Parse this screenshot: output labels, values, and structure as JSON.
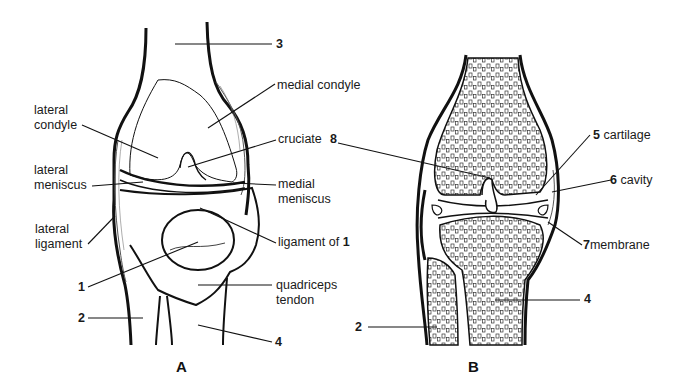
{
  "figures": [
    {
      "id": "A",
      "caption": "A"
    },
    {
      "id": "B",
      "caption": "B"
    }
  ],
  "figure_a": {
    "labels": {
      "n3": "3",
      "medial_condyle": "medial condyle",
      "lateral_condyle_1": "lateral",
      "lateral_condyle_2": "condyle",
      "cruciate": "cruciate",
      "n8": "8",
      "lateral_meniscus_1": "lateral",
      "lateral_meniscus_2": "meniscus",
      "medial_meniscus_1": "medial",
      "medial_meniscus_2": "meniscus",
      "lateral_ligament_1": "lateral",
      "lateral_ligament_2": "ligament",
      "ligament_of": "ligament of",
      "ligament_of_num": "1",
      "n1": "1",
      "quadriceps_1": "quadriceps",
      "quadriceps_2": "tendon",
      "n2": "2",
      "n4": "4"
    }
  },
  "figure_b": {
    "labels": {
      "n5": "5",
      "cartilage": "cartilage",
      "n6": "6",
      "cavity": "cavity",
      "n7": "7",
      "membrane": "membrane",
      "n4": "4",
      "n2": "2"
    }
  }
}
